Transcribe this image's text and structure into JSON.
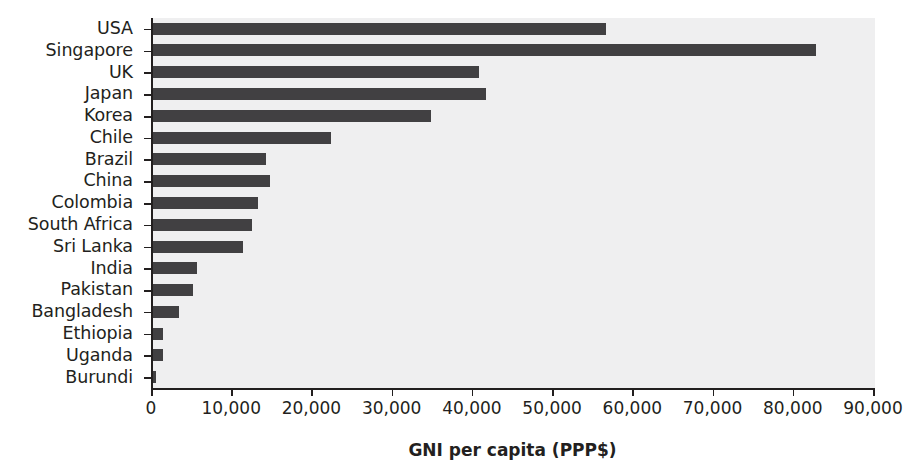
{
  "chart_data": {
    "type": "bar",
    "orientation": "horizontal",
    "title": "",
    "xlabel": "GNI per capita (PPP$)",
    "ylabel": "",
    "xlim": [
      0,
      90000
    ],
    "xticks": [
      0,
      10000,
      20000,
      30000,
      40000,
      50000,
      60000,
      70000,
      80000,
      90000
    ],
    "xticklabels": [
      "0",
      "10,000",
      "20,000",
      "30,000",
      "40,000",
      "50,000",
      "60,000",
      "70,000",
      "80,000",
      "90,000"
    ],
    "grid": false,
    "legend": false,
    "bar_color": "#414042",
    "plot_background": "#efeff0",
    "axis_color": "#221f1f",
    "categories": [
      "USA",
      "Singapore",
      "UK",
      "Japan",
      "Korea",
      "Chile",
      "Brazil",
      "China",
      "Colombia",
      "South Africa",
      "Sri Lanka",
      "India",
      "Pakistan",
      "Bangladesh",
      "Ethiopia",
      "Uganda",
      "Burundi"
    ],
    "values": [
      56500,
      82700,
      40600,
      41500,
      34700,
      22200,
      14100,
      14600,
      13100,
      12300,
      11200,
      5500,
      5000,
      3300,
      1300,
      1200,
      400
    ]
  }
}
